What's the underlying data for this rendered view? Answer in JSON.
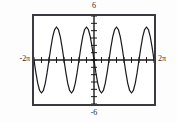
{
  "figure": {
    "kind": "graphing-calculator-plot",
    "background_color": "#fdfdfd",
    "frame_color": "#3a3a40",
    "curve_color": "#1a1a1a"
  },
  "labels": {
    "y_max": "6",
    "y_min": "-6",
    "x_min": "-2π",
    "x_max": "2π"
  },
  "chart_data": {
    "type": "line",
    "title": "",
    "xlabel": "",
    "ylabel": "",
    "xlim": [
      -6.283185,
      6.283185
    ],
    "ylim": [
      -6,
      6
    ],
    "xtick_labels": [
      "-2π",
      "2π"
    ],
    "ytick_labels": [
      "6",
      "-6"
    ],
    "grid": false,
    "legend": null,
    "axis_tick_spacing_x": 0.785398,
    "axis_tick_spacing_y": 1,
    "series": [
      {
        "name": "y = 4.5 sin(2x)",
        "amplitude": 4.5,
        "period": 3.141593,
        "phase": 0,
        "x": [
          -6.283185,
          -6.086836,
          -5.890486,
          -5.694137,
          -5.497787,
          -5.301438,
          -5.105088,
          -4.908739,
          -4.712389,
          -4.516039,
          -4.31969,
          -4.12334,
          -3.926991,
          -3.730641,
          -3.534292,
          -3.337942,
          -3.141593,
          -2.945243,
          -2.748894,
          -2.552544,
          -2.356194,
          -2.159845,
          -1.963495,
          -1.767146,
          -1.570796,
          -1.374447,
          -1.178097,
          -0.981748,
          -0.785398,
          -0.589049,
          -0.392699,
          -0.19635,
          0.0,
          0.19635,
          0.392699,
          0.589049,
          0.785398,
          0.981748,
          1.178097,
          1.374447,
          1.570796,
          1.767146,
          1.963495,
          2.159845,
          2.356194,
          2.552544,
          2.748894,
          2.945243,
          3.141593,
          3.337942,
          3.534292,
          3.730641,
          3.926991,
          4.12334,
          4.31969,
          4.516039,
          4.712389,
          4.908739,
          5.105088,
          5.301438,
          5.497787,
          5.694137,
          5.890486,
          6.086836,
          6.283185
        ],
        "y": [
          0.0,
          -1.722,
          -3.182,
          -4.157,
          -4.5,
          -4.157,
          -3.182,
          -1.722,
          0.0,
          1.722,
          3.182,
          4.157,
          4.5,
          4.157,
          3.182,
          1.722,
          0.0,
          -1.722,
          -3.182,
          -4.157,
          -4.5,
          -4.157,
          -3.182,
          -1.722,
          0.0,
          1.722,
          3.182,
          4.157,
          4.5,
          4.157,
          3.182,
          1.722,
          0.0,
          -1.722,
          -3.182,
          -4.157,
          -4.5,
          -4.157,
          -3.182,
          -1.722,
          0.0,
          1.722,
          3.182,
          4.157,
          4.5,
          4.157,
          3.182,
          1.722,
          0.0,
          -1.722,
          -3.182,
          -4.157,
          -4.5,
          -4.157,
          -3.182,
          -1.722,
          0.0,
          1.722,
          3.182,
          4.157,
          4.5,
          4.157,
          3.182,
          1.722,
          0.0
        ]
      }
    ]
  }
}
